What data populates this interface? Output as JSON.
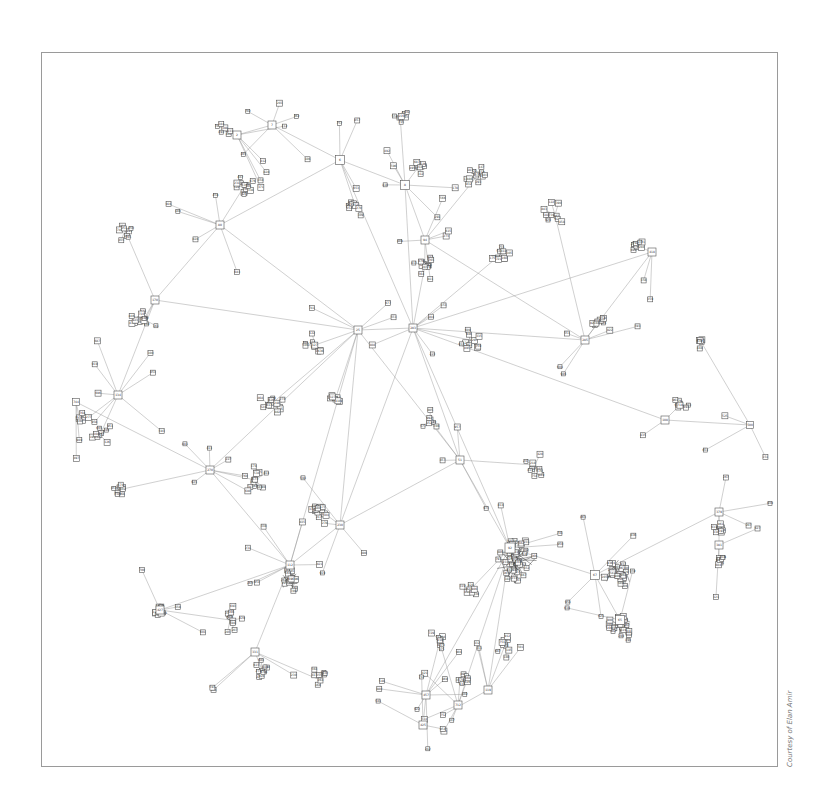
{
  "figure": {
    "type": "network-graph",
    "frame": {
      "x": 41,
      "y": 52,
      "width": 737,
      "height": 715,
      "border_color": "#9a9a9a"
    },
    "credit": "Courtesy of Elan Amir",
    "node_style": {
      "fill": "#ffffff",
      "stroke": "#555555"
    },
    "edge_color": "#888888",
    "dense_edge_color": "#333333"
  },
  "hubs": [
    {
      "id": "h1",
      "label": "6",
      "x": 340,
      "y": 160,
      "size": 9
    },
    {
      "id": "h2",
      "label": "8",
      "x": 405,
      "y": 185,
      "size": 9
    },
    {
      "id": "h3",
      "label": "7",
      "x": 272,
      "y": 125,
      "size": 8
    },
    {
      "id": "h4",
      "label": "2",
      "x": 237,
      "y": 135,
      "size": 8
    },
    {
      "id": "h5",
      "label": "283",
      "x": 413,
      "y": 328,
      "size": 8
    },
    {
      "id": "h6",
      "label": "25",
      "x": 358,
      "y": 330,
      "size": 8
    },
    {
      "id": "h7",
      "label": "80",
      "x": 220,
      "y": 225,
      "size": 8
    },
    {
      "id": "h8",
      "label": "170",
      "x": 155,
      "y": 300,
      "size": 8
    },
    {
      "id": "h9",
      "label": "134",
      "x": 118,
      "y": 395,
      "size": 8
    },
    {
      "id": "h10",
      "label": "270",
      "x": 210,
      "y": 470,
      "size": 8
    },
    {
      "id": "h11",
      "label": "92",
      "x": 510,
      "y": 548,
      "size": 10
    },
    {
      "id": "h12",
      "label": "67",
      "x": 595,
      "y": 575,
      "size": 9
    },
    {
      "id": "h13",
      "label": "65",
      "x": 620,
      "y": 620,
      "size": 9
    },
    {
      "id": "h14",
      "label": "379",
      "x": 719,
      "y": 512,
      "size": 8
    },
    {
      "id": "h15",
      "label": "381",
      "x": 719,
      "y": 545,
      "size": 8
    },
    {
      "id": "h16",
      "label": "112",
      "x": 290,
      "y": 565,
      "size": 8
    },
    {
      "id": "h17",
      "label": "427",
      "x": 160,
      "y": 610,
      "size": 8
    },
    {
      "id": "h18",
      "label": "331",
      "x": 255,
      "y": 652,
      "size": 8
    },
    {
      "id": "h19",
      "label": "457",
      "x": 426,
      "y": 695,
      "size": 8
    },
    {
      "id": "h20",
      "label": "425",
      "x": 423,
      "y": 725,
      "size": 8
    },
    {
      "id": "h21",
      "label": "712",
      "x": 458,
      "y": 705,
      "size": 8
    },
    {
      "id": "h22",
      "label": "119",
      "x": 488,
      "y": 690,
      "size": 8
    },
    {
      "id": "h23",
      "label": "418",
      "x": 652,
      "y": 252,
      "size": 8
    },
    {
      "id": "h24",
      "label": "108",
      "x": 665,
      "y": 420,
      "size": 8
    },
    {
      "id": "h25",
      "label": "285",
      "x": 585,
      "y": 340,
      "size": 8
    },
    {
      "id": "h26",
      "label": "94",
      "x": 425,
      "y": 240,
      "size": 8
    },
    {
      "id": "h27",
      "label": "51",
      "x": 460,
      "y": 460,
      "size": 8
    },
    {
      "id": "h28",
      "label": "230",
      "x": 340,
      "y": 525,
      "size": 8
    },
    {
      "id": "h29",
      "label": "744",
      "x": 76,
      "y": 402,
      "size": 7
    },
    {
      "id": "h30",
      "label": "500",
      "x": 750,
      "y": 425,
      "size": 7
    }
  ],
  "clusters": [
    {
      "hub": "h1",
      "cx": 355,
      "cy": 205,
      "count": 10,
      "r": 12
    },
    {
      "hub": "h2",
      "cx": 420,
      "cy": 165,
      "count": 8,
      "r": 10
    },
    {
      "hub": "h7",
      "cx": 245,
      "cy": 185,
      "count": 14,
      "r": 10
    },
    {
      "hub": "h8",
      "cx": 145,
      "cy": 320,
      "count": 14,
      "r": 14
    },
    {
      "hub": "h8",
      "cx": 125,
      "cy": 230,
      "count": 8,
      "r": 12
    },
    {
      "hub": "h9",
      "cx": 100,
      "cy": 435,
      "count": 10,
      "r": 14
    },
    {
      "hub": "h10",
      "cx": 118,
      "cy": 490,
      "count": 8,
      "r": 8
    },
    {
      "hub": "h26",
      "cx": 478,
      "cy": 175,
      "count": 12,
      "r": 14
    },
    {
      "hub": "h5",
      "cx": 425,
      "cy": 265,
      "count": 14,
      "r": 12
    },
    {
      "hub": "h5",
      "cx": 500,
      "cy": 255,
      "count": 10,
      "r": 12
    },
    {
      "hub": "h11",
      "cx": 515,
      "cy": 560,
      "count": 40,
      "r": 22
    },
    {
      "hub": "h12",
      "cx": 620,
      "cy": 575,
      "count": 24,
      "r": 16
    },
    {
      "hub": "h13",
      "cx": 620,
      "cy": 625,
      "count": 20,
      "r": 12
    },
    {
      "hub": "h14",
      "cx": 719,
      "cy": 528,
      "count": 10,
      "r": 6
    },
    {
      "hub": "h15",
      "cx": 719,
      "cy": 560,
      "count": 10,
      "r": 6
    },
    {
      "hub": "h16",
      "cx": 290,
      "cy": 580,
      "count": 18,
      "r": 12
    },
    {
      "hub": "h17",
      "cx": 160,
      "cy": 612,
      "count": 12,
      "r": 6
    },
    {
      "hub": "h18",
      "cx": 262,
      "cy": 670,
      "count": 10,
      "r": 10
    },
    {
      "hub": "h23",
      "cx": 635,
      "cy": 245,
      "count": 10,
      "r": 8
    },
    {
      "hub": "h24",
      "cx": 680,
      "cy": 405,
      "count": 10,
      "r": 10
    },
    {
      "hub": "h25",
      "cx": 600,
      "cy": 320,
      "count": 8,
      "r": 10
    },
    {
      "hub": "h27",
      "cx": 535,
      "cy": 465,
      "count": 10,
      "r": 12
    },
    {
      "hub": "h28",
      "cx": 320,
      "cy": 510,
      "count": 14,
      "r": 14
    },
    {
      "hub": "h6",
      "cx": 315,
      "cy": 345,
      "count": 10,
      "r": 12
    },
    {
      "hub": "h6",
      "cx": 270,
      "cy": 405,
      "count": 14,
      "r": 14
    },
    {
      "hub": "h6",
      "cx": 335,
      "cy": 400,
      "count": 8,
      "r": 10
    },
    {
      "hub": "h10",
      "cx": 255,
      "cy": 480,
      "count": 12,
      "r": 14
    },
    {
      "hub": "h5",
      "cx": 470,
      "cy": 340,
      "count": 10,
      "r": 12
    },
    {
      "hub": "h27",
      "cx": 430,
      "cy": 420,
      "count": 8,
      "r": 10
    },
    {
      "hub": "h22",
      "cx": 505,
      "cy": 645,
      "count": 10,
      "r": 14
    },
    {
      "hub": "h19",
      "cx": 440,
      "cy": 640,
      "count": 8,
      "r": 12
    },
    {
      "hub": "h18",
      "cx": 320,
      "cy": 680,
      "count": 8,
      "r": 12
    },
    {
      "hub": "h25",
      "cx": 555,
      "cy": 215,
      "count": 10,
      "r": 16
    },
    {
      "hub": "h2",
      "cx": 400,
      "cy": 115,
      "count": 8,
      "r": 12
    },
    {
      "hub": "h4",
      "cx": 222,
      "cy": 128,
      "count": 6,
      "r": 10
    },
    {
      "hub": "h30",
      "cx": 700,
      "cy": 340,
      "count": 6,
      "r": 12
    },
    {
      "hub": "h29",
      "cx": 80,
      "cy": 420,
      "count": 6,
      "r": 8
    },
    {
      "hub": "h17",
      "cx": 230,
      "cy": 620,
      "count": 10,
      "r": 14
    },
    {
      "hub": "h11",
      "cx": 470,
      "cy": 590,
      "count": 8,
      "r": 10
    },
    {
      "hub": "h21",
      "cx": 460,
      "cy": 680,
      "count": 6,
      "r": 8
    }
  ],
  "links": [
    [
      "h1",
      "h2"
    ],
    [
      "h1",
      "h3"
    ],
    [
      "h3",
      "h4"
    ],
    [
      "h1",
      "h5"
    ],
    [
      "h2",
      "h5"
    ],
    [
      "h2",
      "h26"
    ],
    [
      "h5",
      "h6"
    ],
    [
      "h6",
      "h7"
    ],
    [
      "h6",
      "h8"
    ],
    [
      "h8",
      "h9"
    ],
    [
      "h6",
      "h10"
    ],
    [
      "h10",
      "h29"
    ],
    [
      "h5",
      "h11"
    ],
    [
      "h11",
      "h12"
    ],
    [
      "h12",
      "h13"
    ],
    [
      "h12",
      "h14"
    ],
    [
      "h14",
      "h15"
    ],
    [
      "h6",
      "h16"
    ],
    [
      "h16",
      "h17"
    ],
    [
      "h16",
      "h18"
    ],
    [
      "h11",
      "h19"
    ],
    [
      "h19",
      "h20"
    ],
    [
      "h11",
      "h21"
    ],
    [
      "h11",
      "h22"
    ],
    [
      "h5",
      "h23"
    ],
    [
      "h5",
      "h24"
    ],
    [
      "h24",
      "h30"
    ],
    [
      "h5",
      "h25"
    ],
    [
      "h5",
      "h27"
    ],
    [
      "h27",
      "h28"
    ],
    [
      "h28",
      "h16"
    ],
    [
      "h6",
      "h28"
    ],
    [
      "h1",
      "h7"
    ],
    [
      "h25",
      "h23"
    ],
    [
      "h27",
      "h11"
    ],
    [
      "h5",
      "h28"
    ],
    [
      "h26",
      "h25"
    ],
    [
      "h6",
      "h27"
    ],
    [
      "h10",
      "h16"
    ],
    [
      "h8",
      "h7"
    ]
  ]
}
